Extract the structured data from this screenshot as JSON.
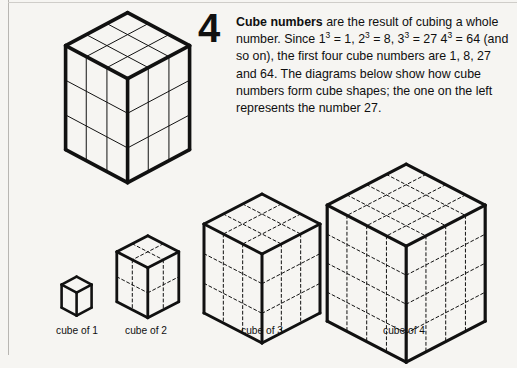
{
  "page": {
    "background_color": "#f6f5f2",
    "ink_color": "#111111",
    "rule_color": "#b8b6b2"
  },
  "article": {
    "number": "4",
    "heading": "Cube numbers",
    "paragraph_rest": " are the result of cubing a whole number. Since 1³ = 1, 2³ = 8, 3³ = 27 4³ = 64 (and so on), the first four cube numbers are 1, 8, 27 and 64. The diagrams below show how cube numbers form cube shapes; the one on the left represents the number 27.",
    "lines": [
      "are the result of cubing a",
      "whole number. Since 1³ = 1, 2³ = 8, 3³ = 27",
      "4³ = 64 (and so on), the first four cube",
      "numbers are 1, 8, 27 and 64. The diagrams",
      "below show how cube numbers form cube",
      "shapes; the one on the left represents the",
      "number 27."
    ],
    "equations": [
      {
        "expr": "1³ = 1",
        "base": 1,
        "power": 3,
        "value": 1
      },
      {
        "expr": "2³ = 8",
        "base": 2,
        "power": 3,
        "value": 8
      },
      {
        "expr": "3³ = 27",
        "base": 3,
        "power": 3,
        "value": 27
      },
      {
        "expr": "4³ = 64",
        "base": 4,
        "power": 3,
        "value": 64
      }
    ],
    "cube_numbers": [
      1,
      8,
      27,
      64
    ],
    "featured_cube_value": 27
  },
  "diagrams": {
    "hero": {
      "name": "cube of 3 (large)",
      "divisions": 3,
      "unit_cubes": 27,
      "grid_style": "solid",
      "outline_width": 3.6,
      "grid_width": 1.0,
      "origin_x": 128,
      "origin_y": 13,
      "half_width": 62,
      "rise": 33,
      "side_height": 104,
      "caption": ""
    },
    "row": [
      {
        "name": "cube of 1",
        "divisions": 1,
        "unit_cubes": 1,
        "grid_style": "dashed",
        "outline_width": 2.6,
        "grid_width": 1.0,
        "origin_x": 77,
        "origin_y": 277,
        "half_width": 15,
        "rise": 8,
        "side_height": 23,
        "caption": "cube of 1",
        "caption_x": 77,
        "caption_y": 325
      },
      {
        "name": "cube of 2",
        "divisions": 2,
        "unit_cubes": 8,
        "grid_style": "dashed",
        "outline_width": 2.8,
        "grid_width": 1.0,
        "origin_x": 148,
        "origin_y": 236,
        "half_width": 31,
        "rise": 16,
        "side_height": 50,
        "caption": "cube of 2",
        "caption_x": 146,
        "caption_y": 325
      },
      {
        "name": "cube of 3",
        "divisions": 3,
        "unit_cubes": 27,
        "grid_style": "dashed",
        "outline_width": 3.0,
        "grid_width": 1.0,
        "origin_x": 262,
        "origin_y": 194,
        "half_width": 58,
        "rise": 30,
        "side_height": 89,
        "caption": "cube of 3",
        "caption_x": 262,
        "caption_y": 325
      },
      {
        "name": "cube of 4",
        "divisions": 4,
        "unit_cubes": 64,
        "grid_style": "dashed",
        "outline_width": 3.2,
        "grid_width": 1.0,
        "origin_x": 406,
        "origin_y": 164,
        "half_width": 79,
        "rise": 41,
        "side_height": 116,
        "caption": "cube of 4",
        "caption_x": 404,
        "caption_y": 325
      }
    ]
  }
}
